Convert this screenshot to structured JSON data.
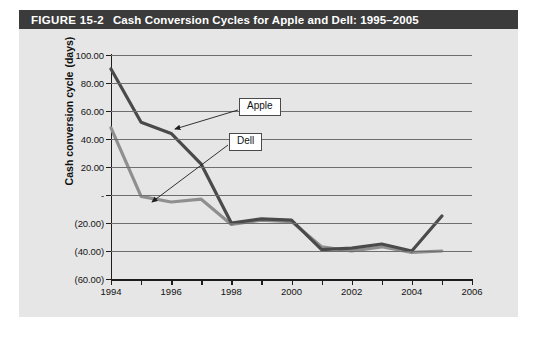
{
  "figure": {
    "number": "FIGURE 15-2",
    "title": "Cash Conversion Cycles for Apple and Dell: 1995–2005"
  },
  "axes": {
    "y_title_line1": "Cash conversion cycle",
    "y_title_line2": "(days)",
    "y_ticklabels": [
      "100.00",
      "80.00",
      "60.00",
      "40.00",
      "20.00",
      "-",
      "(20.00)",
      "(40.00)",
      "(60.00)"
    ],
    "y_tickvalues": [
      100,
      80,
      60,
      40,
      20,
      0,
      -20,
      -40,
      -60
    ],
    "x_ticklabels": [
      "1994",
      "1996",
      "1998",
      "2000",
      "2002",
      "2004",
      "2006"
    ],
    "x_tickvalues": [
      1994,
      1996,
      1998,
      2000,
      2002,
      2004,
      2006
    ]
  },
  "annotations": [
    {
      "name": "apple-callout",
      "label": "Apple"
    },
    {
      "name": "dell-callout",
      "label": "Dell"
    }
  ],
  "colors": {
    "header_bar": "#3b3b3b",
    "panel_bg": "#e6e6e6",
    "apple_line": "#4a4a4a",
    "dell_line": "#8f8f8f",
    "grid": "#6e6e6e",
    "axis": "#1d1d1d"
  },
  "chart_data": {
    "type": "line",
    "xlabel": "",
    "ylabel": "Cash conversion cycle (days)",
    "xlim": [
      1994,
      2006
    ],
    "ylim": [
      -60,
      100
    ],
    "grid": true,
    "legend": "annotated callouts",
    "x": [
      1994,
      1995,
      1996,
      1997,
      1998,
      1999,
      2000,
      2001,
      2002,
      2003,
      2004,
      2005
    ],
    "series": [
      {
        "name": "Apple",
        "color": "#4a4a4a",
        "values": [
          90,
          52,
          44,
          22,
          -20,
          -17,
          -18,
          -39,
          -38,
          -35,
          -40,
          -15
        ]
      },
      {
        "name": "Dell",
        "color": "#8f8f8f",
        "values": [
          48,
          -1,
          -5,
          -3,
          -21,
          -18,
          -19,
          -37,
          -40,
          -37,
          -41,
          -40
        ]
      }
    ]
  }
}
